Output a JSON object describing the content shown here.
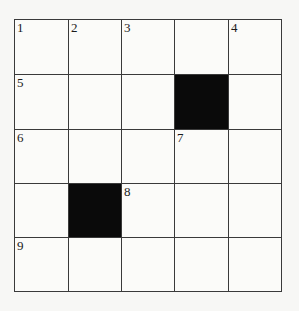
{
  "crossword": {
    "rows": 5,
    "cols": 5,
    "cells": [
      [
        {
          "num": "1"
        },
        {
          "num": "2"
        },
        {
          "num": "3"
        },
        {
          "num": ""
        },
        {
          "num": "4"
        }
      ],
      [
        {
          "num": "5"
        },
        {
          "num": ""
        },
        {
          "num": ""
        },
        {
          "block": true
        },
        {
          "num": ""
        }
      ],
      [
        {
          "num": "6"
        },
        {
          "num": ""
        },
        {
          "num": ""
        },
        {
          "num": "7"
        },
        {
          "num": ""
        }
      ],
      [
        {
          "num": ""
        },
        {
          "block": true
        },
        {
          "num": "8"
        },
        {
          "num": ""
        },
        {
          "num": ""
        }
      ],
      [
        {
          "num": "9"
        },
        {
          "num": ""
        },
        {
          "num": ""
        },
        {
          "num": ""
        },
        {
          "num": ""
        }
      ]
    ],
    "colors": {
      "block": "#0a0a0a",
      "line": "#3a3a3a",
      "background": "#fbfbf9"
    }
  }
}
